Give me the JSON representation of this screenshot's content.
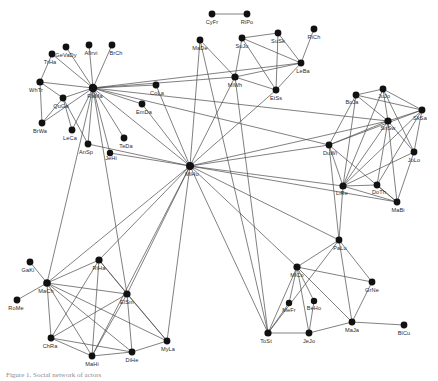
{
  "figure": {
    "caption": "Figure 1. Social network of actors",
    "background_color": "#ffffff",
    "node_color": "#111111",
    "edge_color": "#4a4a4a",
    "label_color": "#2b2b2b"
  },
  "chart_data": {
    "type": "network-graph",
    "title": "",
    "xlabel": "",
    "ylabel": "",
    "grid": false,
    "legend": "none",
    "node_count": 54,
    "edge_count": 121,
    "nodes": [
      {
        "id": "GeVaDy",
        "label": "GeVaDy",
        "x": 66,
        "y": 47,
        "lx": 66,
        "ly": 57,
        "r": 3.4
      },
      {
        "id": "AlIrvi",
        "label": "AlIrvi",
        "x": 89,
        "y": 45,
        "lx": 91,
        "ly": 55,
        "r": 3.4
      },
      {
        "id": "BrCh",
        "label": "BrCh",
        "x": 112,
        "y": 45,
        "lx": 116,
        "ly": 55,
        "r": 3.4
      },
      {
        "id": "TrHa",
        "label": "TrHa",
        "x": 52,
        "y": 54,
        "lx": 50,
        "ly": 64,
        "r": 3.4
      },
      {
        "id": "WhTr",
        "label": "WhTr",
        "x": 40,
        "y": 82,
        "lx": 36,
        "ly": 92,
        "r": 3.6
      },
      {
        "id": "QuGa",
        "label": "QuGa",
        "x": 63,
        "y": 98,
        "lx": 61,
        "ly": 108,
        "r": 3.4
      },
      {
        "id": "BrWa",
        "label": "BrWa",
        "x": 42,
        "y": 123,
        "lx": 40,
        "ly": 133,
        "r": 3.4
      },
      {
        "id": "RaMa",
        "label": "RaMa",
        "x": 93,
        "y": 88,
        "lx": 95,
        "ly": 98,
        "r": 4.2
      },
      {
        "id": "LeCa",
        "label": "LeCa",
        "x": 72,
        "y": 130,
        "lx": 70,
        "ly": 140,
        "r": 3.4
      },
      {
        "id": "AnSp",
        "label": "AnSp",
        "x": 88,
        "y": 144,
        "lx": 86,
        "ly": 154,
        "r": 3.4
      },
      {
        "id": "TeDa",
        "label": "TeDa",
        "x": 124,
        "y": 138,
        "lx": 126,
        "ly": 148,
        "r": 3.4
      },
      {
        "id": "JeHi",
        "label": "JeHi",
        "x": 110,
        "y": 153,
        "lx": 111,
        "ly": 160,
        "r": 3.2
      },
      {
        "id": "CoLa",
        "label": "CoLa",
        "x": 156,
        "y": 85,
        "lx": 157,
        "ly": 95,
        "r": 3.4
      },
      {
        "id": "EmDa",
        "label": "EmDa",
        "x": 142,
        "y": 104,
        "lx": 144,
        "ly": 114,
        "r": 3.4
      },
      {
        "id": "MiHu",
        "label": "MiHu",
        "x": 190,
        "y": 166,
        "lx": 192,
        "ly": 176,
        "r": 4.0
      },
      {
        "id": "MaDe",
        "label": "MaDe",
        "x": 200,
        "y": 40,
        "lx": 200,
        "ly": 50,
        "r": 3.4
      },
      {
        "id": "CyFr",
        "label": "CyFr",
        "x": 212,
        "y": 14,
        "lx": 212,
        "ly": 24,
        "r": 3.4
      },
      {
        "id": "RiPo",
        "label": "RiPo",
        "x": 247,
        "y": 14,
        "lx": 247,
        "ly": 24,
        "r": 3.4
      },
      {
        "id": "SuJu",
        "label": "SuJu",
        "x": 242,
        "y": 38,
        "lx": 242,
        "ly": 48,
        "r": 3.4
      },
      {
        "id": "SuSk",
        "label": "SuSk",
        "x": 278,
        "y": 33,
        "lx": 278,
        "ly": 43,
        "r": 3.4
      },
      {
        "id": "RiCh",
        "label": "RiCh",
        "x": 314,
        "y": 29,
        "lx": 314,
        "ly": 39,
        "r": 3.4
      },
      {
        "id": "LeBa",
        "label": "LeBa",
        "x": 301,
        "y": 63,
        "lx": 303,
        "ly": 73,
        "r": 3.4
      },
      {
        "id": "MiWh",
        "label": "MiWh",
        "x": 235,
        "y": 77,
        "lx": 235,
        "ly": 87,
        "r": 3.6
      },
      {
        "id": "EtSs",
        "label": "EtSs",
        "x": 276,
        "y": 90,
        "lx": 276,
        "ly": 100,
        "r": 3.4
      },
      {
        "id": "BoJa",
        "label": "BoJa",
        "x": 356,
        "y": 95,
        "lx": 352,
        "ly": 104,
        "r": 3.4
      },
      {
        "id": "JuJo",
        "label": "JuJo",
        "x": 383,
        "y": 89,
        "lx": 384,
        "ly": 98,
        "r": 3.4
      },
      {
        "id": "SkSa",
        "label": "SkSa",
        "x": 422,
        "y": 110,
        "lx": 420,
        "ly": 120,
        "r": 3.4
      },
      {
        "id": "SnSw",
        "label": "SnSw",
        "x": 388,
        "y": 121,
        "lx": 388,
        "ly": 130,
        "r": 3.6
      },
      {
        "id": "DuWi",
        "label": "DuWi",
        "x": 329,
        "y": 145,
        "lx": 330,
        "ly": 155,
        "r": 3.4
      },
      {
        "id": "JoLo",
        "label": "JoLo",
        "x": 414,
        "y": 152,
        "lx": 414,
        "ly": 162,
        "r": 3.4
      },
      {
        "id": "LiRe",
        "label": "LiRe",
        "x": 343,
        "y": 186,
        "lx": 342,
        "ly": 195,
        "r": 3.6
      },
      {
        "id": "DoTh",
        "label": "DoTh",
        "x": 377,
        "y": 185,
        "lx": 379,
        "ly": 194,
        "r": 3.4
      },
      {
        "id": "MaBi",
        "label": "MaBi",
        "x": 397,
        "y": 202,
        "lx": 398,
        "ly": 212,
        "r": 3.4
      },
      {
        "id": "PaLu",
        "label": "PaLu",
        "x": 339,
        "y": 240,
        "lx": 340,
        "ly": 250,
        "r": 3.4
      },
      {
        "id": "MiCo",
        "label": "MiCo",
        "x": 297,
        "y": 267,
        "lx": 297,
        "ly": 277,
        "r": 3.6
      },
      {
        "id": "MeFr",
        "label": "MeFr",
        "x": 289,
        "y": 303,
        "lx": 289,
        "ly": 312,
        "r": 3.2
      },
      {
        "id": "BeHo",
        "label": "BeHo",
        "x": 314,
        "y": 301,
        "lx": 314,
        "ly": 310,
        "r": 3.2
      },
      {
        "id": "GrNe",
        "label": "GrNe",
        "x": 372,
        "y": 282,
        "lx": 372,
        "ly": 292,
        "r": 3.4
      },
      {
        "id": "MaJa",
        "label": "MaJa",
        "x": 352,
        "y": 322,
        "lx": 352,
        "ly": 332,
        "r": 3.4
      },
      {
        "id": "BlCu",
        "label": "BlCu",
        "x": 404,
        "y": 325,
        "lx": 404,
        "ly": 335,
        "r": 3.4
      },
      {
        "id": "JeJo",
        "label": "JeJo",
        "x": 309,
        "y": 333,
        "lx": 309,
        "ly": 343,
        "r": 3.4
      },
      {
        "id": "ToSt",
        "label": "ToSt",
        "x": 268,
        "y": 333,
        "lx": 266,
        "ly": 343,
        "r": 3.6
      },
      {
        "id": "GaKi",
        "label": "GaKi",
        "x": 30,
        "y": 262,
        "lx": 28,
        "ly": 272,
        "r": 3.4
      },
      {
        "id": "MaCh",
        "label": "MaCh",
        "x": 47,
        "y": 283,
        "lx": 46,
        "ly": 293,
        "r": 3.8
      },
      {
        "id": "RoMe",
        "label": "RoMe",
        "x": 17,
        "y": 300,
        "lx": 16,
        "ly": 310,
        "r": 3.4
      },
      {
        "id": "RiHa",
        "label": "RiHa",
        "x": 99,
        "y": 260,
        "lx": 99,
        "ly": 270,
        "r": 3.6
      },
      {
        "id": "ElSm",
        "label": "ElSm",
        "x": 127,
        "y": 294,
        "lx": 127,
        "ly": 304,
        "r": 3.6
      },
      {
        "id": "ChRa",
        "label": "ChRa",
        "x": 51,
        "y": 338,
        "lx": 50,
        "ly": 348,
        "r": 3.4
      },
      {
        "id": "MaHi",
        "label": "MaHi",
        "x": 92,
        "y": 356,
        "lx": 92,
        "ly": 366,
        "r": 3.4
      },
      {
        "id": "DiHe",
        "label": "DiHe",
        "x": 132,
        "y": 352,
        "lx": 132,
        "ly": 362,
        "r": 3.4
      },
      {
        "id": "MyLa",
        "label": "MyLa",
        "x": 167,
        "y": 341,
        "lx": 168,
        "ly": 351,
        "r": 3.4
      }
    ],
    "edges": [
      [
        "RaMa",
        "GeVaDy"
      ],
      [
        "RaMa",
        "AlIrvi"
      ],
      [
        "RaMa",
        "BrCh"
      ],
      [
        "RaMa",
        "TrHa"
      ],
      [
        "RaMa",
        "WhTr"
      ],
      [
        "RaMa",
        "QuGa"
      ],
      [
        "RaMa",
        "LeCa"
      ],
      [
        "RaMa",
        "AnSp"
      ],
      [
        "RaMa",
        "TeDa"
      ],
      [
        "RaMa",
        "JeHi"
      ],
      [
        "RaMa",
        "CoLa"
      ],
      [
        "RaMa",
        "EmDa"
      ],
      [
        "RaMa",
        "MiHu"
      ],
      [
        "RaMa",
        "MiWh"
      ],
      [
        "RaMa",
        "LeBa"
      ],
      [
        "RaMa",
        "SnSw"
      ],
      [
        "RaMa",
        "DuWi"
      ],
      [
        "RaMa",
        "ElSm"
      ],
      [
        "RaMa",
        "MaCh"
      ],
      [
        "RaMa",
        "BrWa"
      ],
      [
        "WhTr",
        "QuGa"
      ],
      [
        "WhTr",
        "BrWa"
      ],
      [
        "QuGa",
        "BrWa"
      ],
      [
        "QuGa",
        "AnSp"
      ],
      [
        "QuGa",
        "LeCa"
      ],
      [
        "TrHa",
        "WhTr"
      ],
      [
        "CyFr",
        "RiPo"
      ],
      [
        "SuJu",
        "SuSk"
      ],
      [
        "SuJu",
        "LeBa"
      ],
      [
        "SuJu",
        "MiWh"
      ],
      [
        "SuJu",
        "EtSs"
      ],
      [
        "SuSk",
        "LeBa"
      ],
      [
        "SuSk",
        "EtSs"
      ],
      [
        "RiCh",
        "LeBa"
      ],
      [
        "LeBa",
        "MiWh"
      ],
      [
        "LeBa",
        "EtSs"
      ],
      [
        "MiWh",
        "EtSs"
      ],
      [
        "MiWh",
        "MaDe"
      ],
      [
        "MaDe",
        "MiHu"
      ],
      [
        "MaDe",
        "ToSt"
      ],
      [
        "MiWh",
        "MiHu"
      ],
      [
        "MiWh",
        "ToSt"
      ],
      [
        "EtSs",
        "MiHu"
      ],
      [
        "CoLa",
        "MiHu"
      ],
      [
        "EmDa",
        "MiHu"
      ],
      [
        "MiHu",
        "DuWi"
      ],
      [
        "MiHu",
        "LiRe"
      ],
      [
        "MiHu",
        "MaBi"
      ],
      [
        "MiHu",
        "PaLu"
      ],
      [
        "MiHu",
        "MiCo"
      ],
      [
        "MiHu",
        "ToSt"
      ],
      [
        "MiHu",
        "ElSm"
      ],
      [
        "MiHu",
        "MaCh"
      ],
      [
        "MiHu",
        "RiHa"
      ],
      [
        "MiHu",
        "MyLa"
      ],
      [
        "MiHu",
        "MaHi"
      ],
      [
        "MiHu",
        "JeHi"
      ],
      [
        "MiHu",
        "AnSp"
      ],
      [
        "MiHu",
        "SnSw"
      ],
      [
        "BoJa",
        "JuJo"
      ],
      [
        "BoJa",
        "SnSw"
      ],
      [
        "BoJa",
        "LiRe"
      ],
      [
        "BoJa",
        "DuWi"
      ],
      [
        "BoJa",
        "SkSa"
      ],
      [
        "JuJo",
        "SnSw"
      ],
      [
        "JuJo",
        "SkSa"
      ],
      [
        "JuJo",
        "LiRe"
      ],
      [
        "JuJo",
        "JoLo"
      ],
      [
        "SkSa",
        "SnSw"
      ],
      [
        "SkSa",
        "JoLo"
      ],
      [
        "SkSa",
        "LiRe"
      ],
      [
        "SkSa",
        "DoTh"
      ],
      [
        "SkSa",
        "DuWi"
      ],
      [
        "SnSw",
        "DuWi"
      ],
      [
        "SnSw",
        "LiRe"
      ],
      [
        "SnSw",
        "JoLo"
      ],
      [
        "SnSw",
        "DoTh"
      ],
      [
        "SnSw",
        "MaBi"
      ],
      [
        "DuWi",
        "LiRe"
      ],
      [
        "DuWi",
        "MaBi"
      ],
      [
        "JoLo",
        "LiRe"
      ],
      [
        "JoLo",
        "MaBi"
      ],
      [
        "LiRe",
        "DoTh"
      ],
      [
        "LiRe",
        "MaBi"
      ],
      [
        "DoTh",
        "MaBi"
      ],
      [
        "LiRe",
        "PaLu"
      ],
      [
        "DuWi",
        "PaLu"
      ],
      [
        "PaLu",
        "MiCo"
      ],
      [
        "PaLu",
        "GrNe"
      ],
      [
        "PaLu",
        "MaJa"
      ],
      [
        "PaLu",
        "ToSt"
      ],
      [
        "MiCo",
        "MeFr"
      ],
      [
        "MiCo",
        "BeHo"
      ],
      [
        "MiCo",
        "JeJo"
      ],
      [
        "MiCo",
        "MaJa"
      ],
      [
        "MiCo",
        "ToSt"
      ],
      [
        "MiCo",
        "GrNe"
      ],
      [
        "MeFr",
        "ToSt"
      ],
      [
        "BeHo",
        "JeJo"
      ],
      [
        "MaJa",
        "JeJo"
      ],
      [
        "MaJa",
        "BlCu"
      ],
      [
        "MaJa",
        "GrNe"
      ],
      [
        "ToSt",
        "JeJo"
      ],
      [
        "GaKi",
        "MaCh"
      ],
      [
        "MaCh",
        "RoMe"
      ],
      [
        "MaCh",
        "RiHa"
      ],
      [
        "MaCh",
        "ElSm"
      ],
      [
        "MaCh",
        "ChRa"
      ],
      [
        "MaCh",
        "MaHi"
      ],
      [
        "MaCh",
        "MyLa"
      ],
      [
        "MaCh",
        "DiHe"
      ],
      [
        "RiHa",
        "ElSm"
      ],
      [
        "RiHa",
        "ChRa"
      ],
      [
        "RiHa",
        "MaHi"
      ],
      [
        "ElSm",
        "ChRa"
      ],
      [
        "ElSm",
        "MaHi"
      ],
      [
        "ElSm",
        "DiHe"
      ],
      [
        "ElSm",
        "MyLa"
      ],
      [
        "ChRa",
        "MaHi"
      ],
      [
        "MaHi",
        "DiHe"
      ],
      [
        "DiHe",
        "MyLa"
      ],
      [
        "RiHa",
        "MyLa"
      ],
      [
        "ChRa",
        "DiHe"
      ]
    ]
  }
}
